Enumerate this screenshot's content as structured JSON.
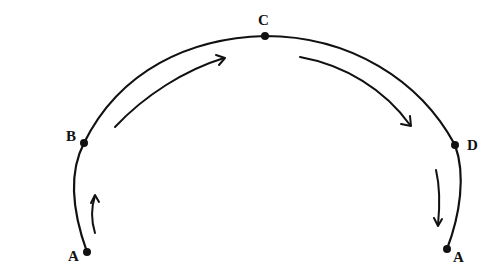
{
  "diagram": {
    "type": "semicircular-path-with-direction-arrows",
    "stroke_color": "#111111",
    "background": "#ffffff",
    "points": [
      {
        "id": "A_left",
        "label": "A",
        "dot": [
          87,
          252
        ],
        "label_pos": [
          68,
          260
        ]
      },
      {
        "id": "B",
        "label": "B",
        "dot": [
          84,
          143
        ],
        "label_pos": [
          65,
          140
        ]
      },
      {
        "id": "C",
        "label": "C",
        "dot": [
          265,
          36
        ],
        "label_pos": [
          258,
          25
        ]
      },
      {
        "id": "D",
        "label": "D",
        "dot": [
          455,
          145
        ],
        "label_pos": [
          468,
          150
        ]
      },
      {
        "id": "A_right",
        "label": "A",
        "dot": [
          447,
          249
        ],
        "label_pos": [
          453,
          261
        ]
      }
    ],
    "arrows": [
      {
        "id": "arrow-A-to-B",
        "direction": "up",
        "from": "A_left",
        "to": "B"
      },
      {
        "id": "arrow-B-to-C",
        "direction": "up-right",
        "from": "B",
        "to": "C"
      },
      {
        "id": "arrow-C-to-D",
        "direction": "down-right",
        "from": "C",
        "to": "D"
      },
      {
        "id": "arrow-D-to-A",
        "direction": "down",
        "from": "D",
        "to": "A_right"
      }
    ]
  },
  "labels": {
    "a_left": "A",
    "b": "B",
    "c": "C",
    "d": "D",
    "a_right": "A"
  }
}
